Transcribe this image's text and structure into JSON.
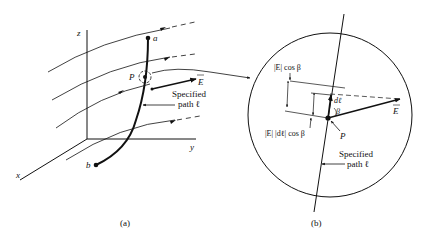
{
  "panel_a": {
    "caption": "(a)",
    "axes": {
      "x": "x",
      "y": "y",
      "z": "z"
    },
    "points": {
      "a": "a",
      "b": "b",
      "P": "P"
    },
    "field_label": "E",
    "path_label_line1": "Specified",
    "path_label_line2": "path ℓ"
  },
  "panel_b": {
    "caption": "(b)",
    "proj_label_top": "|E| cos β",
    "proj_label_bottom": "|E| |dℓ| cos β",
    "dl_label": "dℓ",
    "beta_label": "β",
    "P_label": "P",
    "field_label": "E",
    "path_label_line1": "Specified",
    "path_label_line2": "path ℓ"
  },
  "colors": {
    "ink": "#111111",
    "background": "#ffffff"
  }
}
